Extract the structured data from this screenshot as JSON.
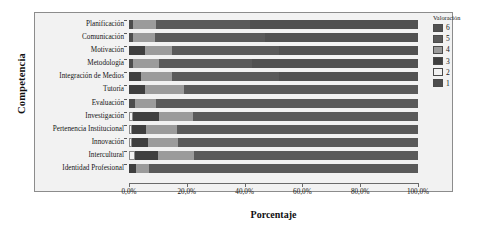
{
  "chart_data": {
    "type": "bar",
    "subtype": "stacked-horizontal-100-percent",
    "title": "",
    "xlabel": "Porcentaje",
    "ylabel": "Competencia",
    "xlim": [
      0,
      100
    ],
    "xtick_values": [
      0,
      20,
      40,
      60,
      80,
      100
    ],
    "xtick_labels": [
      "0,0%",
      "20,0%",
      "40,0%",
      "60,0%",
      "80,0%",
      "100,0%"
    ],
    "grid": false,
    "legend_title": "Valoración",
    "legend_position": "right",
    "series": [
      {
        "name": "1",
        "color": "#4d4d4d"
      },
      {
        "name": "2",
        "color": "#f2f2f2"
      },
      {
        "name": "3",
        "color": "#3f3f3f"
      },
      {
        "name": "4",
        "color": "#9b9b9b"
      },
      {
        "name": "5",
        "color": "#5a5a5a"
      },
      {
        "name": "6",
        "color": "#515151"
      }
    ],
    "categories": [
      "Planificación",
      "Comunicación",
      "Motivación",
      "Metodología",
      "Integración de Medios",
      "Tutoría",
      "Evaluación",
      "Investigación",
      "Pertenencia Institucional",
      "Innovación",
      "Intercultural",
      "Identidad Profesional"
    ],
    "rows": [
      {
        "category": "Planificación",
        "values": [
          1.5,
          0.0,
          0.0,
          8.0,
          32.5,
          58.0
        ]
      },
      {
        "category": "Comunicación",
        "values": [
          1.5,
          0.0,
          0.0,
          7.5,
          38.0,
          53.0
        ]
      },
      {
        "category": "Motivación",
        "values": [
          0.0,
          0.0,
          5.5,
          9.5,
          37.0,
          48.0
        ]
      },
      {
        "category": "Metodología",
        "values": [
          1.5,
          0.0,
          0.0,
          9.0,
          32.0,
          57.5
        ]
      },
      {
        "category": "Integración de Medios",
        "values": [
          0.0,
          0.0,
          4.0,
          11.0,
          37.0,
          48.0
        ]
      },
      {
        "category": "Tutoría",
        "values": [
          0.0,
          0.0,
          5.5,
          13.5,
          81.0,
          0.0
        ]
      },
      {
        "category": "Evaluación",
        "values": [
          2.0,
          0.0,
          0.0,
          7.5,
          90.5,
          0.0
        ]
      },
      {
        "category": "Investigación",
        "values": [
          0.0,
          1.5,
          9.0,
          11.5,
          78.0,
          0.0
        ]
      },
      {
        "category": "Pertenencia Institucional",
        "values": [
          0.0,
          1.0,
          5.0,
          10.5,
          83.5,
          0.0
        ]
      },
      {
        "category": "Innovación",
        "values": [
          0.0,
          1.0,
          5.5,
          10.5,
          83.0,
          0.0
        ]
      },
      {
        "category": "Intercultural",
        "values": [
          0.0,
          2.0,
          8.0,
          12.5,
          77.5,
          0.0
        ]
      },
      {
        "category": "Identidad Profesional",
        "values": [
          0.0,
          0.0,
          2.5,
          4.5,
          93.0,
          0.0
        ]
      }
    ]
  },
  "legend": {
    "title": "Valoración",
    "items": [
      {
        "label": "6",
        "color": "#515151"
      },
      {
        "label": "5",
        "color": "#5a5a5a"
      },
      {
        "label": "4",
        "color": "#9b9b9b"
      },
      {
        "label": "3",
        "color": "#3f3f3f"
      },
      {
        "label": "2",
        "color": "#f2f2f2"
      },
      {
        "label": "1",
        "color": "#4d4d4d"
      }
    ]
  },
  "axes": {
    "x_title": "Porcentaje",
    "y_title": "Competencia",
    "x_ticks": [
      "0,0%",
      "20,0%",
      "40,0%",
      "60,0%",
      "80,0%",
      "100,0%"
    ],
    "y_ticks": [
      "Planificación",
      "Comunicación",
      "Motivación",
      "Metodología",
      "Integración de Medios",
      "Tutoría",
      "Evaluación",
      "Investigación",
      "Pertenencia Institucional",
      "Innovación",
      "Intercultural",
      "Identidad Profesional"
    ]
  }
}
